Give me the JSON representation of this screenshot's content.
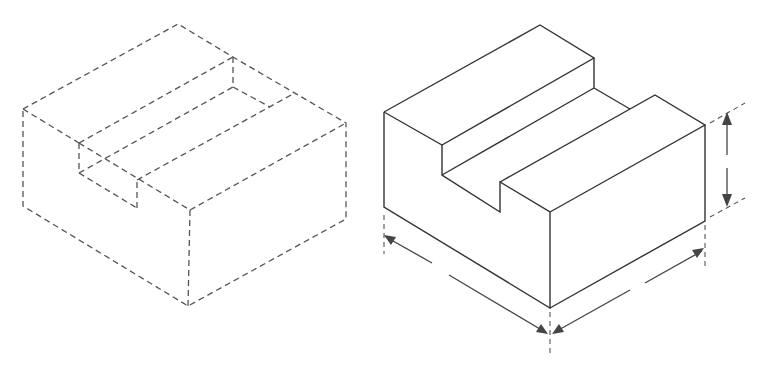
{
  "figure": {
    "colors": {
      "background": "#ffffff",
      "line": "#333333",
      "dashed_line": "#555555"
    },
    "views": [
      {
        "name": "dashed-isometric-view",
        "style": "dashed"
      },
      {
        "name": "solid-isometric-view",
        "style": "solid",
        "dimensions": [
          "height",
          "width",
          "depth"
        ]
      }
    ]
  }
}
